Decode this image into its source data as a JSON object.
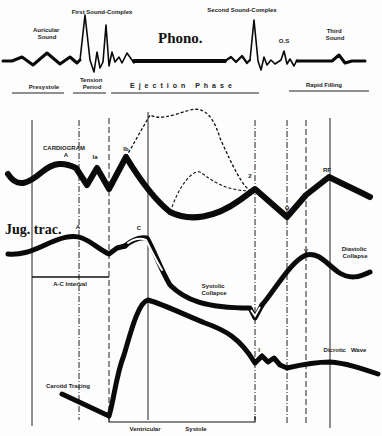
{
  "diagram": {
    "title": "Phono.",
    "phono": {
      "labels": {
        "auricular": [
          "Auricular",
          "Sound"
        ],
        "first": "First Sound-Complex",
        "second": "Second Sound-Complex",
        "os": "O.S",
        "third": [
          "Third",
          "Sound"
        ]
      }
    },
    "phases": {
      "presystole": "Presystole",
      "tension": [
        "Tension",
        "Period"
      ],
      "ejection": "Ejection Phase",
      "rapid_filling": "Rapid Filling"
    },
    "cardiogram": {
      "title": "CARDIOGRAM",
      "points": {
        "a": "A",
        "ia": "Ia",
        "ib": "Ib",
        "two": "2",
        "o": "O",
        "rf": "RF"
      }
    },
    "jugular": {
      "title": "Jug. trac.",
      "points": {
        "a": "A",
        "c": "C",
        "v": "V"
      },
      "labels": {
        "ac_interval": "A-C Interval",
        "systolic_collapse": [
          "Systolic",
          "Collapse"
        ],
        "diastolic_collapse": [
          "Diastolic",
          "Collapse"
        ]
      }
    },
    "carotid": {
      "title": "Carotid Tracing",
      "points": {
        "i": "I"
      },
      "labels": {
        "dicrotic": "Dicrotic   Wave",
        "ventricular_systole": [
          "Ventricular",
          "Systole"
        ]
      }
    },
    "vertical_markers_x": [
      32,
      79,
      109,
      148,
      255,
      287,
      306,
      330
    ]
  }
}
